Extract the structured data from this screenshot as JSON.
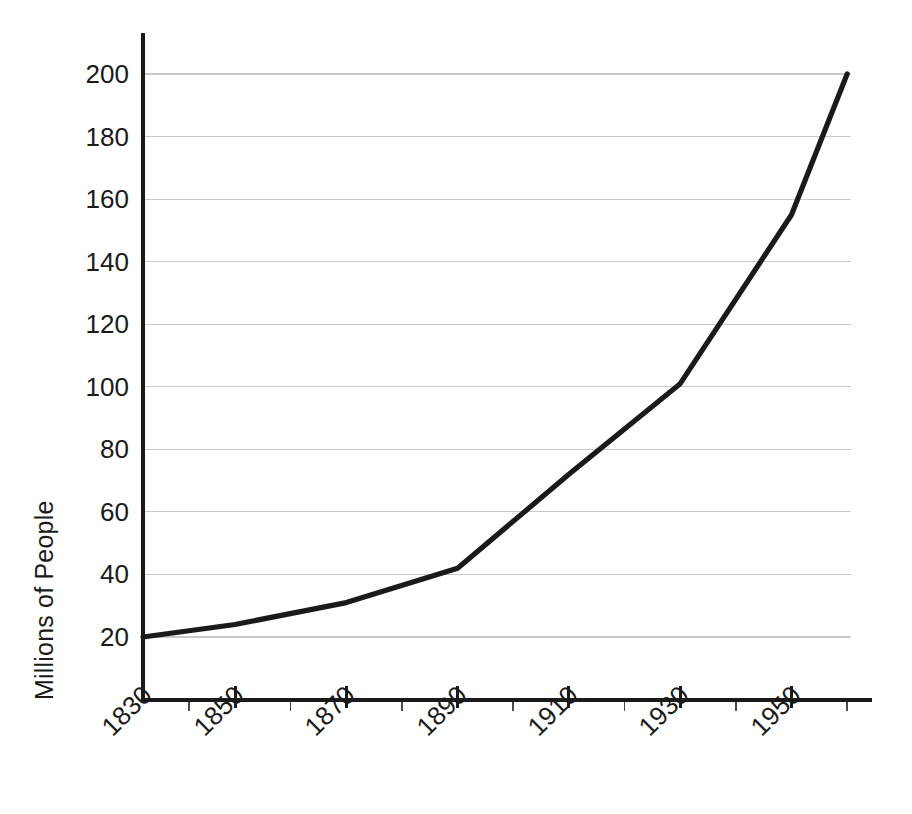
{
  "chart_data": {
    "type": "line",
    "title": "",
    "xlabel": "",
    "ylabel": "Millions of People",
    "xlim": [
      1830,
      1962
    ],
    "ylim": [
      0,
      212
    ],
    "grid": true,
    "legend": "none",
    "x_major_ticks": [
      1830,
      1850,
      1870,
      1890,
      1910,
      1930,
      1950
    ],
    "x_major_tick_labels": [
      "1830",
      "1850",
      "1870",
      "1890",
      "1910",
      "1930",
      "1950"
    ],
    "x_minor_ticks": [
      1840,
      1860,
      1880,
      1900,
      1920,
      1940,
      1960
    ],
    "y_ticks": [
      20,
      40,
      60,
      80,
      100,
      120,
      140,
      160,
      180,
      200
    ],
    "y_tick_labels": [
      "20",
      "40",
      "60",
      "80",
      "100",
      "120",
      "140",
      "160",
      "180",
      "200"
    ],
    "x": [
      1830,
      1850,
      1870,
      1890,
      1910,
      1930,
      1950,
      1960
    ],
    "values": [
      20,
      24,
      31,
      42,
      72,
      101,
      155,
      200
    ],
    "series": [
      {
        "name": "Population",
        "x": [
          1830,
          1850,
          1870,
          1890,
          1910,
          1930,
          1950,
          1960
        ],
        "values": [
          20,
          24,
          31,
          42,
          72,
          101,
          155,
          200
        ]
      }
    ],
    "line_color": "#1a1a1a",
    "grid_color": "#c9c9c9",
    "axis_color": "#1a1a1a",
    "background_color": "#ffffff"
  }
}
